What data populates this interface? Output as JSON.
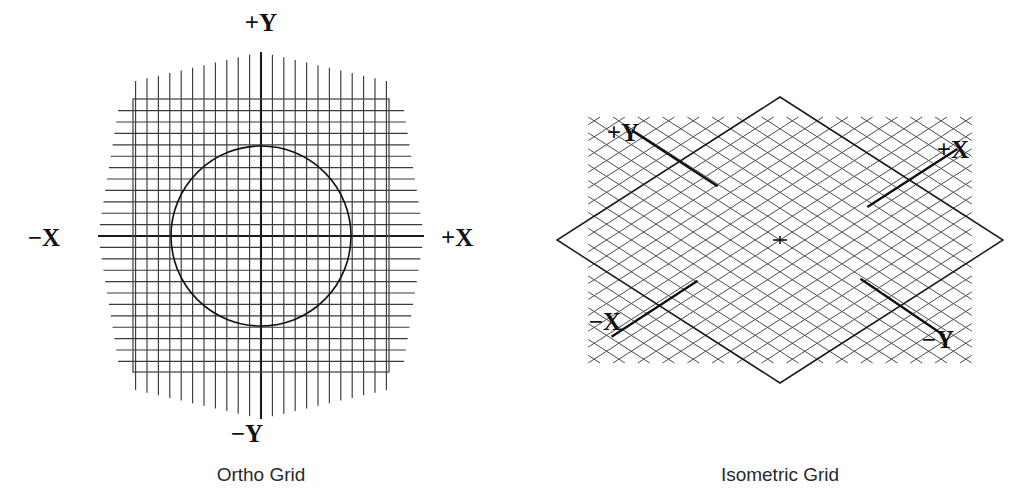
{
  "figure": {
    "background_color": "#ffffff",
    "ink_color": "#111111",
    "panels": [
      {
        "id": "ortho",
        "caption": "Ortho Grid",
        "type": "orthographic-grid",
        "axis_labels": {
          "positive_y": "+Y",
          "negative_y": "−Y",
          "positive_x": "+X",
          "negative_x": "−X"
        },
        "geometry": {
          "center_x": 261,
          "center_y": 236,
          "grid_spacing": 11.4,
          "grid_half_count": 11,
          "square_left": 133,
          "square_top": 99,
          "square_right": 389,
          "square_bottom": 372,
          "hatch_left": 98,
          "hatch_right": 424,
          "hatch_top": 52,
          "hatch_bottom": 419,
          "circle_radius": 90
        },
        "label_positions": {
          "positive_y": {
            "x": 261,
            "y": 31
          },
          "negative_y": {
            "x": 247,
            "y": 442
          },
          "positive_x": {
            "x": 441,
            "y": 246
          },
          "negative_x": {
            "x": 60,
            "y": 246
          }
        },
        "caption_position": {
          "x": 261,
          "y": 481
        }
      },
      {
        "id": "isometric",
        "caption": "Isometric Grid",
        "type": "isometric-grid",
        "axis_labels": {
          "positive_y": "+Y",
          "negative_y": "−Y",
          "positive_x": "+X",
          "negative_x": "−X"
        },
        "geometry": {
          "center_x": 780,
          "center_y": 240,
          "left_vertex_x": 557,
          "right_vertex_x": 1003,
          "top_vertex_y": 97,
          "bottom_vertex_y": 383,
          "grid_steps": 18,
          "hatch_inset": 0.14
        },
        "label_positions": {
          "positive_y": {
            "x": 623,
            "y": 141
          },
          "positive_x": {
            "x": 953,
            "y": 158
          },
          "negative_x": {
            "x": 605,
            "y": 330
          },
          "negative_y": {
            "x": 938,
            "y": 348
          }
        },
        "caption_position": {
          "x": 780,
          "y": 481
        }
      }
    ]
  }
}
